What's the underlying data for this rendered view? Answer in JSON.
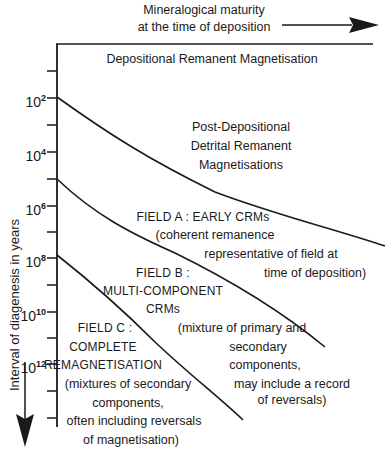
{
  "top_axis": {
    "label_line1": "Mineralogical maturity",
    "label_line2": "at the time of deposition",
    "arrow_icon": "arrow-right-icon"
  },
  "left_axis": {
    "label": "Interval of diagenesis in years",
    "arrow_icon": "arrow-down-icon",
    "ticks": [
      {
        "base": "10",
        "exp": "2"
      },
      {
        "base": "10",
        "exp": "4"
      },
      {
        "base": "10",
        "exp": "6"
      },
      {
        "base": "10",
        "exp": "8"
      },
      {
        "base": "10",
        "exp": "10"
      },
      {
        "base": "10",
        "exp": "12"
      }
    ]
  },
  "regions": {
    "drm": {
      "title": "Depositional Remanent Magnetisation"
    },
    "pddrm": {
      "line1": "Post-Depositional",
      "line2": "Detrital Remanent",
      "line3": "Magnetisations"
    },
    "field_a": {
      "title": "FIELD A : EARLY CRMs",
      "desc1": "(coherent remanence",
      "desc2": "representative of field at",
      "desc3": "time of deposition)"
    },
    "field_b": {
      "title1": "FIELD B :",
      "title2": "MULTI-COMPONENT",
      "title3": "CRMs",
      "desc1": "(mixture of primary and",
      "desc2": "secondary",
      "desc3": "components,",
      "desc4": "may include a record",
      "desc5": "of reversals)"
    },
    "field_c": {
      "title1": "FIELD C :",
      "title2": "COMPLETE",
      "title3": "REMAGNETISATION",
      "desc1": "(mixtures of secondary",
      "desc2": "components,",
      "desc3": "often including reversals",
      "desc4": "of magnetisation)"
    }
  },
  "colors": {
    "ink": "#1a1a1a",
    "background": "#ffffff"
  }
}
